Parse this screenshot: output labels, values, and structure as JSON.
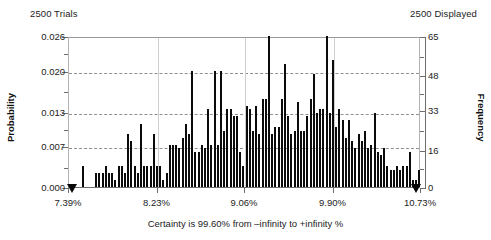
{
  "header": {
    "trials_label": "2500 Trials",
    "displayed_label": "2500 Displayed"
  },
  "caption": "Certainty is 99.60% from –infinity to +infinity %",
  "axes": {
    "y_left_title": "Probability",
    "y_right_title": "Frequency"
  },
  "chart_data": {
    "type": "bar",
    "subtitle": "Certainty is 99.60% from –infinity to +infinity %",
    "xlabel": "",
    "ylabel": "Probability",
    "y2label": "Frequency",
    "grid": true,
    "legend": null,
    "trials": 2500,
    "displayed": 2500,
    "certainty_percent": 99.6,
    "certainty_range": [
      "–infinity",
      "+infinity"
    ],
    "xlim": [
      7.39,
      10.73
    ],
    "ylim": [
      0.0,
      0.026
    ],
    "y2lim": [
      0,
      65
    ],
    "xticks": [
      "7.39%",
      "8.23%",
      "9.06%",
      "9.90%",
      "10.73%"
    ],
    "xtick_values": [
      7.39,
      8.23,
      9.06,
      9.9,
      10.73
    ],
    "yticks": [
      "0.000",
      "0.007",
      "0.013",
      "0.020",
      "0.026"
    ],
    "ytick_values": [
      0.0,
      0.007,
      0.013,
      0.02,
      0.026
    ],
    "y2ticks": [
      "0",
      "16",
      "33",
      "48",
      "65"
    ],
    "y2tick_values": [
      0,
      16,
      33,
      48,
      65
    ],
    "gridline_values": [
      0.007,
      0.013,
      0.02
    ],
    "grabbers": [
      7.39,
      10.73
    ],
    "bin_count": 110,
    "values": [
      0.0,
      0.0,
      0.0,
      0.0,
      0.0036,
      0.0,
      0.0,
      0.0,
      0.0024,
      0.0024,
      0.0024,
      0.0036,
      0.0024,
      0.0024,
      0.0012,
      0.0036,
      0.0036,
      0.0024,
      0.0091,
      0.0079,
      0.0036,
      0.0024,
      0.0109,
      0.0036,
      0.0036,
      0.0036,
      0.0091,
      0.0036,
      0.0036,
      0.0012,
      0.0024,
      0.0073,
      0.0073,
      0.0073,
      0.0067,
      0.0085,
      0.0109,
      0.0091,
      0.02,
      0.0061,
      0.0061,
      0.0073,
      0.0067,
      0.0134,
      0.0073,
      0.02,
      0.0073,
      0.02,
      0.0097,
      0.0134,
      0.0134,
      0.0122,
      0.0122,
      0.0061,
      0.0036,
      0.014,
      0.0134,
      0.0097,
      0.014,
      0.0091,
      0.0152,
      0.0152,
      0.026,
      0.0091,
      0.0103,
      0.0103,
      0.0152,
      0.0212,
      0.0122,
      0.0091,
      0.0097,
      0.0146,
      0.0097,
      0.0097,
      0.0122,
      0.0152,
      0.0195,
      0.0128,
      0.0134,
      0.0134,
      0.026,
      0.0128,
      0.0218,
      0.0103,
      0.0134,
      0.0116,
      0.0085,
      0.0116,
      0.0079,
      0.0067,
      0.0091,
      0.0079,
      0.0097,
      0.0067,
      0.0073,
      0.0128,
      0.0061,
      0.0055,
      0.0067,
      0.0036,
      0.003,
      0.003,
      0.0036,
      0.003,
      0.0036,
      0.0036,
      0.0061,
      0.0012,
      0.0012,
      0.003
    ]
  }
}
